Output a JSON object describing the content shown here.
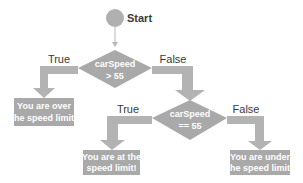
{
  "colors": {
    "shape_fill": "#a9a9a9",
    "arrow_fill": "#b3b3b3",
    "text_on_shape": "#ffffff",
    "label_text": "#3a3a3a",
    "background": "#ffffff"
  },
  "start": {
    "label": "Start"
  },
  "decision1": {
    "line1": "carSpeed",
    "line2": "> 55",
    "true_label": "True",
    "false_label": "False"
  },
  "decision2": {
    "line1": "carSpeed",
    "line2": "== 55",
    "true_label": "True",
    "false_label": "False"
  },
  "outcomes": {
    "over": {
      "line1": "You are over",
      "line2": "the speed limit!"
    },
    "at": {
      "line1": "You are at the",
      "line2": "speed limit!"
    },
    "under": {
      "line1": "You are under",
      "line2": "the speed limit!"
    }
  }
}
